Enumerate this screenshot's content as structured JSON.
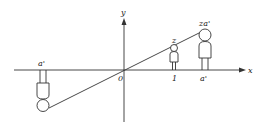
{
  "diagram": {
    "type": "coordinate-projection",
    "axes": {
      "x_label": "x",
      "y_label": "y",
      "origin_label": "0"
    },
    "figures": [
      {
        "name": "small-figure",
        "top_label": "z",
        "bottom_label": "1"
      },
      {
        "name": "large-figure",
        "top_label": "za'",
        "bottom_label": "a'"
      },
      {
        "name": "inverted-figure",
        "top_label": "a'"
      }
    ],
    "stroke_color": "#333333",
    "background": "#ffffff"
  }
}
